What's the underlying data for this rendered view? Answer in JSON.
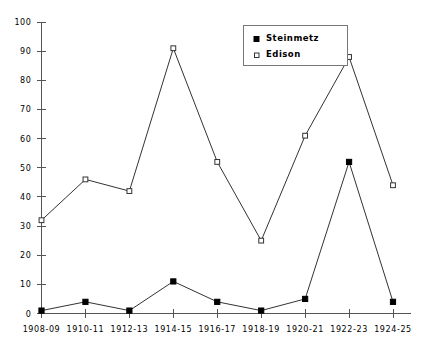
{
  "chart_data": {
    "type": "line",
    "title": "",
    "subtitle": "",
    "xlabel": "",
    "ylabel": "",
    "categories": [
      "1908-09",
      "1910-11",
      "1912-13",
      "1914-15",
      "1916-17",
      "1918-19",
      "1920-21",
      "1922-23",
      "1924-25"
    ],
    "series": [
      {
        "name": "Steinmetz",
        "marker": "filled-square",
        "color": "#000000",
        "values": [
          1,
          4,
          1,
          11,
          4,
          1,
          5,
          52,
          4
        ]
      },
      {
        "name": "Edison",
        "marker": "open-square",
        "color": "#333333",
        "values": [
          32,
          46,
          42,
          91,
          52,
          25,
          61,
          88,
          44
        ]
      }
    ],
    "ylim": [
      0,
      100
    ],
    "y_ticks": [
      0,
      10,
      20,
      30,
      40,
      50,
      60,
      70,
      80,
      90,
      100
    ],
    "y_tick_labels": [
      "0",
      "10",
      "20",
      "30",
      "40",
      "50",
      "60",
      "70",
      "80",
      "90",
      "100"
    ],
    "grid": false,
    "legend_position": "top-center-right",
    "legend_entries": [
      {
        "label": "Steinmetz",
        "marker": "filled-square"
      },
      {
        "label": "Edison",
        "marker": "open-square"
      }
    ]
  },
  "axes": {
    "y_axis_name": "value-axis",
    "x_axis_name": "period-axis"
  }
}
